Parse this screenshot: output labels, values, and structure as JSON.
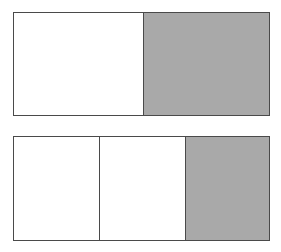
{
  "diagram": {
    "bars": [
      {
        "name": "halves",
        "total_parts": 2,
        "shaded_parts": 1,
        "parts": [
          {
            "shaded": false,
            "color": "#ffffff"
          },
          {
            "shaded": true,
            "color": "#a9a9a9"
          }
        ]
      },
      {
        "name": "thirds",
        "total_parts": 3,
        "shaded_parts": 1,
        "parts": [
          {
            "shaded": false,
            "color": "#ffffff"
          },
          {
            "shaded": false,
            "color": "#ffffff"
          },
          {
            "shaded": true,
            "color": "#a9a9a9"
          }
        ]
      }
    ],
    "colors": {
      "shaded": "#a9a9a9",
      "unshaded": "#ffffff",
      "border": "#4a4a4a"
    }
  }
}
